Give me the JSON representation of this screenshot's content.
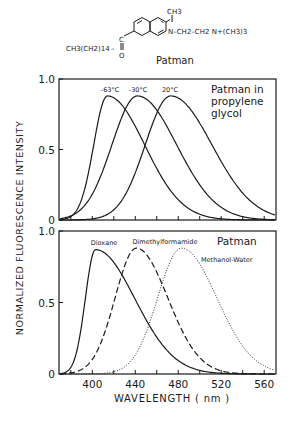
{
  "molecule": {
    "name": "Patman",
    "left_chain": "CH3(CH2)14",
    "carbonyl": "C",
    "oxygen": "O",
    "methyl": "CH3",
    "amine_chain": "N–CH2–CH2 N+(CH3)3"
  },
  "y_axis_label": "NORMALIZED FLUORESCENCE INTENSITY",
  "x_axis_label": "WAVELENGTH ( nm )",
  "chart_data": [
    {
      "type": "line",
      "title": "Patman in propylene glycol",
      "title_lines": [
        "Patman  in",
        "propylene",
        "glycol"
      ],
      "xlabel": "WAVELENGTH ( nm )",
      "ylabel": "NORMALIZED FLUORESCENCE INTENSITY",
      "xlim": [
        369,
        571
      ],
      "ylim": [
        0,
        1.0
      ],
      "yticks": [
        "0",
        "0.5",
        "1.0"
      ],
      "xticks_minor": [
        380,
        400,
        420,
        440,
        460,
        480,
        500,
        520,
        540,
        560
      ],
      "grid": false,
      "series": [
        {
          "name": "-63°C",
          "style": "solid",
          "peak_nm": 414,
          "peak": 0.88,
          "width_left": 16,
          "width_right": 38,
          "shoulder": true
        },
        {
          "name": "-30°C",
          "style": "solid",
          "peak_nm": 442,
          "peak": 0.88,
          "width_left": 30,
          "width_right": 40,
          "shoulder": true
        },
        {
          "name": "20°C",
          "style": "solid",
          "peak_nm": 473,
          "peak": 0.88,
          "width_left": 30,
          "width_right": 42,
          "shoulder": false
        }
      ]
    },
    {
      "type": "line",
      "title": "Patman",
      "xlabel": "WAVELENGTH ( nm )",
      "ylabel": "NORMALIZED FLUORESCENCE INTENSITY",
      "xlim": [
        369,
        571
      ],
      "ylim": [
        0,
        1.0
      ],
      "xticks": [
        "400",
        "440",
        "480",
        "520",
        "560"
      ],
      "yticks": [
        "0",
        "0.5",
        "1.0"
      ],
      "grid": false,
      "series": [
        {
          "name": "Dioxane",
          "style": "solid",
          "peak_nm": 403,
          "peak": 0.87,
          "width_left": 12,
          "width_right": 40
        },
        {
          "name": "Dimethylformamide",
          "style": "dashed",
          "peak_nm": 441,
          "peak": 0.88,
          "width_left": 25,
          "width_right": 32
        },
        {
          "name": "Methanol-Water",
          "style": "dotted",
          "peak_nm": 483,
          "peak": 0.88,
          "width_left": 28,
          "width_right": 36
        }
      ]
    }
  ]
}
